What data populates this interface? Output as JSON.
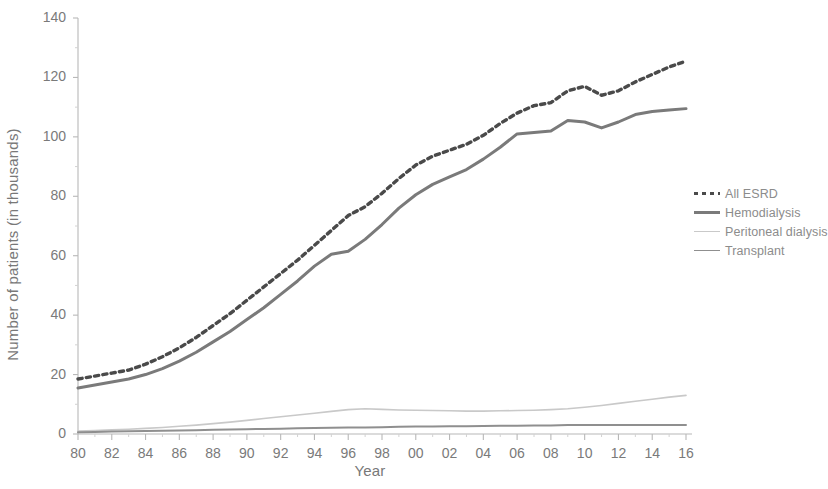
{
  "chart_data": {
    "type": "line",
    "title": "",
    "xlabel": "Year",
    "ylabel": "Number of patients (in thousands)",
    "xlim": [
      1980,
      2016
    ],
    "ylim": [
      0,
      140
    ],
    "yticks": [
      0,
      20,
      40,
      60,
      80,
      100,
      120,
      140
    ],
    "ytick_labels": [
      "0",
      "20",
      "40",
      "60",
      "80",
      "100",
      "120",
      "140"
    ],
    "xticks": [
      1980,
      1982,
      1984,
      1986,
      1988,
      1990,
      1992,
      1994,
      1996,
      1998,
      2000,
      2002,
      2004,
      2006,
      2008,
      2010,
      2012,
      2014,
      2016
    ],
    "xtick_labels": [
      "80",
      "82",
      "84",
      "86",
      "88",
      "90",
      "92",
      "94",
      "96",
      "98",
      "00",
      "02",
      "04",
      "06",
      "08",
      "10",
      "12",
      "14",
      "16"
    ],
    "grid": false,
    "legend_position": "right",
    "x": [
      1980,
      1981,
      1982,
      1983,
      1984,
      1985,
      1986,
      1987,
      1988,
      1989,
      1990,
      1991,
      1992,
      1993,
      1994,
      1995,
      1996,
      1997,
      1998,
      1999,
      2000,
      2001,
      2002,
      2003,
      2004,
      2005,
      2006,
      2007,
      2008,
      2009,
      2010,
      2011,
      2012,
      2013,
      2014,
      2015,
      2016
    ],
    "series": [
      {
        "name": "All ESRD",
        "style": "dashed",
        "color": "#4a4a4a",
        "width": 3.4,
        "values": [
          18.5,
          19.5,
          20.5,
          21.5,
          23.5,
          26.0,
          29.0,
          32.5,
          36.5,
          40.5,
          45.0,
          49.5,
          54.0,
          58.5,
          63.5,
          68.5,
          73.5,
          76.5,
          81.0,
          86.0,
          90.5,
          93.5,
          95.5,
          97.5,
          100.5,
          104.5,
          108.0,
          110.5,
          111.5,
          115.5,
          117.0,
          114.0,
          115.5,
          118.5,
          121.0,
          123.5,
          125.5
        ]
      },
      {
        "name": "Hemodialysis",
        "style": "solid",
        "color": "#7a7a7a",
        "width": 3.0,
        "values": [
          15.5,
          16.5,
          17.5,
          18.5,
          20.0,
          22.0,
          24.5,
          27.5,
          31.0,
          34.5,
          38.5,
          42.5,
          47.0,
          51.5,
          56.5,
          60.5,
          61.5,
          65.5,
          70.5,
          76.0,
          80.5,
          84.0,
          86.5,
          89.0,
          92.5,
          96.5,
          101.0,
          101.5,
          102.0,
          105.5,
          105.0,
          103.0,
          105.0,
          107.5,
          108.5,
          109.0,
          109.5
        ]
      },
      {
        "name": "Peritoneal dialysis",
        "style": "solid",
        "color": "#c9c9c9",
        "width": 1.6,
        "values": [
          1.0,
          1.2,
          1.4,
          1.6,
          1.9,
          2.2,
          2.6,
          3.0,
          3.5,
          4.0,
          4.6,
          5.2,
          5.8,
          6.4,
          7.0,
          7.6,
          8.2,
          8.5,
          8.3,
          8.1,
          8.0,
          7.9,
          7.8,
          7.7,
          7.7,
          7.8,
          7.9,
          8.0,
          8.2,
          8.5,
          9.0,
          9.6,
          10.3,
          11.0,
          11.7,
          12.4,
          13.0
        ]
      },
      {
        "name": "Transplant",
        "style": "solid",
        "color": "#8f8f8f",
        "width": 2.0,
        "values": [
          0.6,
          0.7,
          0.8,
          0.9,
          1.0,
          1.1,
          1.2,
          1.3,
          1.4,
          1.5,
          1.6,
          1.7,
          1.8,
          1.9,
          2.0,
          2.1,
          2.2,
          2.2,
          2.3,
          2.4,
          2.5,
          2.5,
          2.6,
          2.6,
          2.7,
          2.8,
          2.8,
          2.9,
          2.9,
          3.0,
          3.0,
          3.0,
          3.0,
          3.0,
          3.0,
          3.0,
          3.0
        ]
      }
    ]
  },
  "legend": {
    "items": [
      {
        "label": "All ESRD"
      },
      {
        "label": "Hemodialysis"
      },
      {
        "label": "Peritoneal dialysis"
      },
      {
        "label": "Transplant"
      }
    ]
  },
  "axis_colors": {
    "axis_line": "#b8b8b8",
    "tick_text": "#7a7a7a",
    "background": "#ffffff"
  }
}
